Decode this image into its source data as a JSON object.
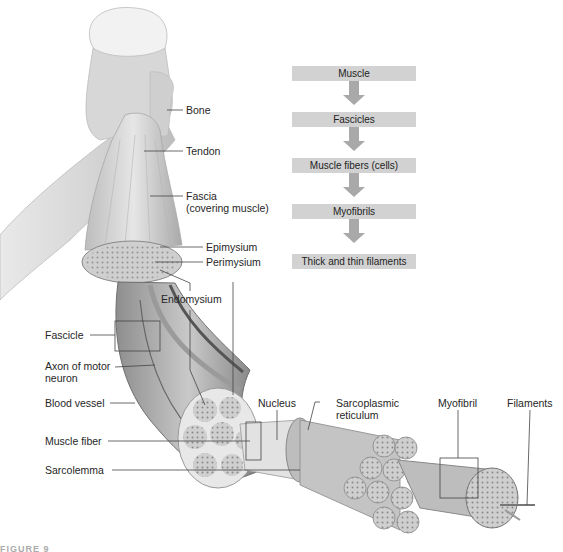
{
  "figure": {
    "caption_fragment": "FIGURE 9",
    "flowchart": {
      "steps": [
        "Muscle",
        "Fascicles",
        "Muscle fibers (cells)",
        "Myofibrils",
        "Thick and thin filaments"
      ],
      "box_color": "#d2d2d2",
      "arrow_color": "#a9a9a9"
    },
    "labels": {
      "bone": "Bone",
      "tendon": "Tendon",
      "fascia_line1": "Fascia",
      "fascia_line2": "(covering muscle)",
      "epimysium": "Epimysium",
      "perimysium": "Perimysium",
      "endomysium": "Endomysium",
      "fascicle": "Fascicle",
      "axon_line1": "Axon of motor",
      "axon_line2": "neuron",
      "blood_vessel": "Blood vessel",
      "muscle_fiber": "Muscle fiber",
      "sarcolemma": "Sarcolemma",
      "nucleus": "Nucleus",
      "sarcoplasmic_line1": "Sarcoplasmic",
      "sarcoplasmic_line2": "reticulum",
      "myofibril": "Myofibril",
      "filaments": "Filaments"
    }
  }
}
